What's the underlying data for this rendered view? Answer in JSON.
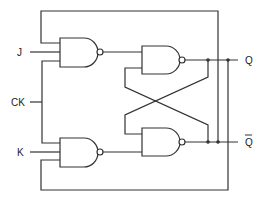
{
  "diagram": {
    "labels": {
      "j": "J",
      "ck": "CK",
      "k": "K",
      "q": "Q",
      "q_bar": "Q"
    },
    "gates": [
      {
        "id": "nand-j",
        "type": "NAND",
        "inputs": [
          "Q̄ feedback",
          "J",
          "CK"
        ]
      },
      {
        "id": "nand-k",
        "type": "NAND",
        "inputs": [
          "CK",
          "K",
          "Q feedback"
        ]
      },
      {
        "id": "nand-latch-top",
        "type": "NAND",
        "output": "Q"
      },
      {
        "id": "nand-latch-bottom",
        "type": "NAND",
        "output": "Q̄"
      }
    ],
    "colors": {
      "line": "#333333",
      "background": "#ffffff"
    }
  }
}
